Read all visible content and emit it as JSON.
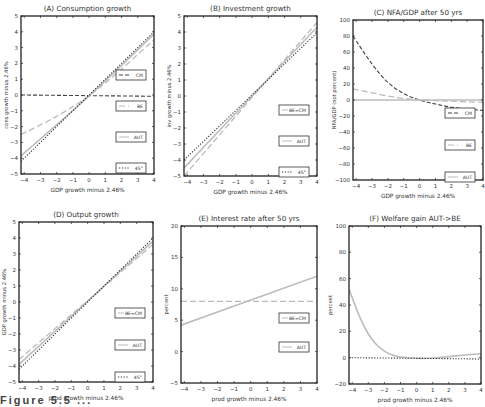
{
  "caption": "Figure 5.5 ...",
  "chart_data": [
    {
      "id": "A",
      "type": "line",
      "title": "(A) Consumption growth",
      "xlabel": "GDP growth minus 2.46%",
      "ylabel": "cons growth minus 2.46%",
      "xlim": [
        -4.2,
        4
      ],
      "ylim": [
        -5,
        5
      ],
      "xticks": [
        -4,
        -3,
        -2,
        -1,
        0,
        1,
        2,
        3,
        4
      ],
      "yticks": [
        -5,
        -4,
        -3,
        -2,
        -1,
        0,
        1,
        2,
        3,
        4,
        5
      ],
      "legend": [
        "CM",
        "BE",
        "AUT",
        "45°"
      ],
      "series": [
        {
          "name": "CM",
          "style": "dashed-dark",
          "x": [
            -4.2,
            4
          ],
          "y": [
            0,
            -0.08
          ]
        },
        {
          "name": "BE",
          "style": "dashed-light",
          "x": [
            -4.2,
            -2,
            0,
            2,
            4
          ],
          "y": [
            -2.5,
            -1.35,
            -0.05,
            1.65,
            3.5
          ]
        },
        {
          "name": "AUT",
          "style": "solid-light",
          "x": [
            -4.2,
            0,
            4
          ],
          "y": [
            -3.85,
            -0.05,
            3.85
          ]
        },
        {
          "name": "45°",
          "style": "dotted",
          "x": [
            -4.2,
            4
          ],
          "y": [
            -4.2,
            4
          ]
        }
      ]
    },
    {
      "id": "B",
      "type": "line",
      "title": "(B) Investment growth",
      "xlabel": "GDP growth minus 2.46%",
      "ylabel": "inv growth minus 2.46%",
      "xlim": [
        -4.2,
        4
      ],
      "ylim": [
        -5,
        5
      ],
      "xticks": [
        -4,
        -3,
        -2,
        -1,
        0,
        1,
        2,
        3,
        4
      ],
      "yticks": [
        -5,
        -4,
        -3,
        -2,
        -1,
        0,
        1,
        2,
        3,
        4,
        5
      ],
      "legend": [
        "BE=CM",
        "AUT",
        "45°"
      ],
      "series": [
        {
          "name": "BE=CM",
          "style": "dashed-light",
          "x": [
            -4.2,
            4
          ],
          "y": [
            -5.0,
            4.6
          ]
        },
        {
          "name": "AUT",
          "style": "solid-light",
          "x": [
            -4.2,
            4
          ],
          "y": [
            -4.5,
            4.3
          ]
        },
        {
          "name": "45°",
          "style": "dotted",
          "x": [
            -4.2,
            4
          ],
          "y": [
            -4.0,
            3.95
          ]
        }
      ]
    },
    {
      "id": "C",
      "type": "line",
      "title": "(C) NFA/GDP after 50 yrs",
      "xlabel": "GDP growth minus 2.46%",
      "ylabel": "NFA/GDP (not percent)",
      "xlim": [
        -4.2,
        4
      ],
      "ylim": [
        -100,
        100
      ],
      "xticks": [
        -4,
        -3,
        -2,
        -1,
        0,
        1,
        2,
        3,
        4
      ],
      "yticks": [
        -100,
        -80,
        -60,
        -40,
        -20,
        0,
        20,
        40,
        60,
        80,
        100
      ],
      "legend": [
        "CM",
        "BE",
        "AUT"
      ],
      "series": [
        {
          "name": "CM",
          "style": "dashed-dark",
          "x": [
            -4.2,
            -3,
            -2,
            -1,
            0,
            1,
            2,
            3,
            4
          ],
          "y": [
            80,
            45,
            22,
            8,
            0,
            -5,
            -9,
            -11.5,
            -13
          ]
        },
        {
          "name": "BE",
          "style": "dashed-light",
          "x": [
            -4.2,
            -2,
            -1,
            0,
            2,
            4
          ],
          "y": [
            14,
            5,
            2,
            0,
            -1.5,
            -3
          ]
        },
        {
          "name": "AUT",
          "style": "solid-light",
          "x": [
            -4.2,
            4
          ],
          "y": [
            0,
            0
          ]
        }
      ]
    },
    {
      "id": "D",
      "type": "line",
      "title": "(D) Output growth",
      "xlabel": "prod growth minus 2.46%",
      "ylabel": "GDP growth minus 2.46%",
      "xlim": [
        -4.2,
        4
      ],
      "ylim": [
        -5,
        5
      ],
      "xticks": [
        -4,
        -3,
        -2,
        -1,
        0,
        1,
        2,
        3,
        4
      ],
      "yticks": [
        -5,
        -4,
        -3,
        -2,
        -1,
        0,
        1,
        2,
        3,
        4,
        5
      ],
      "legend": [
        "BE=CM",
        "AUT",
        "45°"
      ],
      "series": [
        {
          "name": "BE=CM",
          "style": "dashed-light",
          "x": [
            -4.2,
            4
          ],
          "y": [
            -3.6,
            3.6
          ]
        },
        {
          "name": "AUT",
          "style": "solid-light",
          "x": [
            -4.2,
            4
          ],
          "y": [
            -3.9,
            3.8
          ]
        },
        {
          "name": "45°",
          "style": "dotted",
          "x": [
            -4.2,
            4
          ],
          "y": [
            -4.2,
            4
          ]
        }
      ]
    },
    {
      "id": "E",
      "type": "line",
      "title": "(E) Interest rate after 50 yrs",
      "xlabel": "prod growth minus 2.46%",
      "ylabel": "percent",
      "xlim": [
        -4.2,
        4
      ],
      "ylim": [
        -5,
        20
      ],
      "xticks": [
        -4,
        -3,
        -2,
        -1,
        0,
        1,
        2,
        3,
        4
      ],
      "yticks": [
        -5,
        0,
        5,
        10,
        15,
        20
      ],
      "legend": [
        "BE=CM",
        "AUT"
      ],
      "series": [
        {
          "name": "BE=CM",
          "style": "dashed-light",
          "x": [
            -4.2,
            4
          ],
          "y": [
            8.0,
            8.0
          ]
        },
        {
          "name": "AUT",
          "style": "solid-light",
          "x": [
            -4.2,
            4
          ],
          "y": [
            4.2,
            12.0
          ]
        }
      ]
    },
    {
      "id": "F",
      "type": "line",
      "title": "(F) Welfare gain AUT->BE",
      "xlabel": "prod growth minus 2.46%",
      "ylabel": "percent",
      "xlim": [
        -4.2,
        4
      ],
      "ylim": [
        -20,
        100
      ],
      "xticks": [
        -4,
        -3,
        -2,
        -1,
        0,
        1,
        2,
        3,
        4
      ],
      "yticks": [
        -20,
        0,
        20,
        40,
        60,
        80,
        100
      ],
      "legend": [],
      "series": [
        {
          "name": "welfare gain",
          "style": "solid-light",
          "x": [
            -4.2,
            -3.5,
            -3,
            -2.5,
            -2,
            -1.5,
            -1,
            0,
            1,
            2,
            3,
            4
          ],
          "y": [
            52,
            30,
            18,
            10,
            5,
            2,
            0.5,
            -0.5,
            -0.3,
            0.8,
            2,
            3
          ]
        },
        {
          "name": "zero",
          "style": "dotted",
          "x": [
            -4.2,
            4
          ],
          "y": [
            0,
            -1
          ]
        }
      ]
    }
  ]
}
